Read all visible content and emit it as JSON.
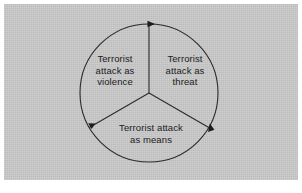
{
  "figure": {
    "kind": "cyclic-three-segment-circle-diagram",
    "panel_color": "#c9c9c9",
    "stroke_color": "#2b2b2b",
    "text_color": "#1c1c1c",
    "flow_direction": "clockwise"
  },
  "circle": {
    "center_x": 149,
    "center_y": 93,
    "radius": 69,
    "segment_count": 3,
    "spoke_angles_deg": [
      270,
      30,
      150
    ],
    "arrow_positions": [
      "top",
      "lower-right",
      "lower-left"
    ]
  },
  "segments": [
    {
      "id": "violence",
      "name": "terrorist-attack-as-violence",
      "lines": [
        "Terrorist",
        "attack as",
        "violence"
      ],
      "full_text": "Terrorist attack as violence"
    },
    {
      "id": "threat",
      "name": "terrorist-attack-as-threat",
      "lines": [
        "Terrorist",
        "attack as",
        "threat"
      ],
      "full_text": "Terrorist attack as threat"
    },
    {
      "id": "means",
      "name": "terrorist-attack-as-means",
      "lines": [
        "Terrorist attack",
        "as means"
      ],
      "full_text": "Terrorist attack as means"
    }
  ],
  "arrows": [
    {
      "id": "arrow-top",
      "name": "clockwise-arrow-top"
    },
    {
      "id": "arrow-lower-right",
      "name": "clockwise-arrow-lower-right"
    },
    {
      "id": "arrow-lower-left",
      "name": "clockwise-arrow-lower-left"
    }
  ]
}
